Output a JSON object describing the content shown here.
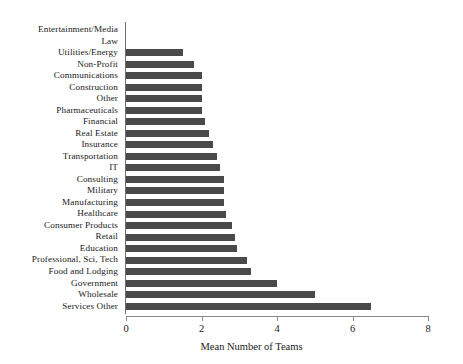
{
  "chart_data": {
    "type": "bar",
    "orientation": "horizontal",
    "title": "",
    "xlabel": "Mean Number of Teams",
    "ylabel": "",
    "xlim": [
      0,
      8
    ],
    "xticks": [
      0,
      2,
      4,
      6,
      8
    ],
    "grid": false,
    "legend": null,
    "bar_color": "#4a4a4a",
    "axis_color": "#8a8a8a",
    "categories": [
      "Entertainment/Media",
      "Law",
      "Utilities/Energy",
      "Non-Profit",
      "Communications",
      "Construction",
      "Other",
      "Pharmaceuticals",
      "Financial",
      "Real Estate",
      "Insurance",
      "Transportation",
      "IT",
      "Consulting",
      "Military",
      "Manufacturing",
      "Healthcare",
      "Consumer Products",
      "Retail",
      "Education",
      "Professional, Sci, Tech",
      "Food and Lodging",
      "Government",
      "Wholesale",
      "Services Other"
    ],
    "values": [
      0.0,
      0.0,
      1.5,
      1.8,
      2.0,
      2.0,
      2.0,
      2.0,
      2.1,
      2.2,
      2.3,
      2.4,
      2.5,
      2.6,
      2.6,
      2.6,
      2.65,
      2.8,
      2.9,
      2.95,
      3.2,
      3.3,
      4.0,
      5.0,
      6.5
    ]
  }
}
